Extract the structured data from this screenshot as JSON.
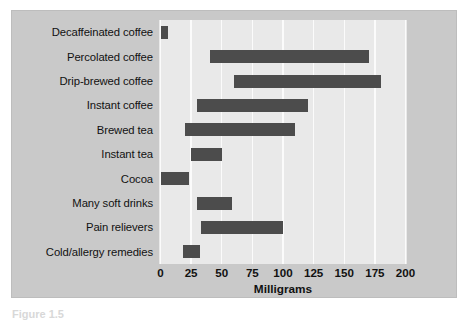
{
  "figure": {
    "caption": "Figure 1.5",
    "background_color": "#ffffff",
    "panel_color": "#c9c9c9",
    "plot_color": "#e9e9e9",
    "bar_color": "#4c4c4c",
    "gridline_color": "#fbfbfb"
  },
  "chart_data": {
    "type": "bar",
    "orientation": "horizontal",
    "bar_style": "floating-range",
    "title": "",
    "subtitle": "",
    "xlabel": "Milligrams",
    "ylabel": "",
    "xlim": [
      0,
      200
    ],
    "xticks": [
      0,
      25,
      50,
      75,
      100,
      125,
      150,
      175,
      200
    ],
    "xtick_labels": [
      "0",
      "25",
      "50",
      "75",
      "100",
      "125",
      "150",
      "175",
      "200"
    ],
    "grid": true,
    "grid_axis": "x",
    "legend": false,
    "legend_position": "none",
    "categories": [
      "Decaffeinated coffee",
      "Percolated coffee",
      "Drip-brewed coffee",
      "Instant coffee",
      "Brewed tea",
      "Instant tea",
      "Cocoa",
      "Many soft drinks",
      "Pain relievers",
      "Cold/allergy remedies"
    ],
    "series": [
      {
        "name": "Caffeine range (mg)",
        "ranges": [
          [
            0,
            6
          ],
          [
            40,
            170
          ],
          [
            60,
            180
          ],
          [
            30,
            120
          ],
          [
            20,
            110
          ],
          [
            25,
            50
          ],
          [
            0,
            23
          ],
          [
            30,
            58
          ],
          [
            33,
            100
          ],
          [
            18,
            32
          ]
        ]
      }
    ],
    "range_starts": [
      0,
      40,
      60,
      30,
      20,
      25,
      0,
      30,
      33,
      18
    ],
    "range_ends": [
      6,
      170,
      180,
      120,
      110,
      50,
      23,
      58,
      100,
      32
    ]
  }
}
